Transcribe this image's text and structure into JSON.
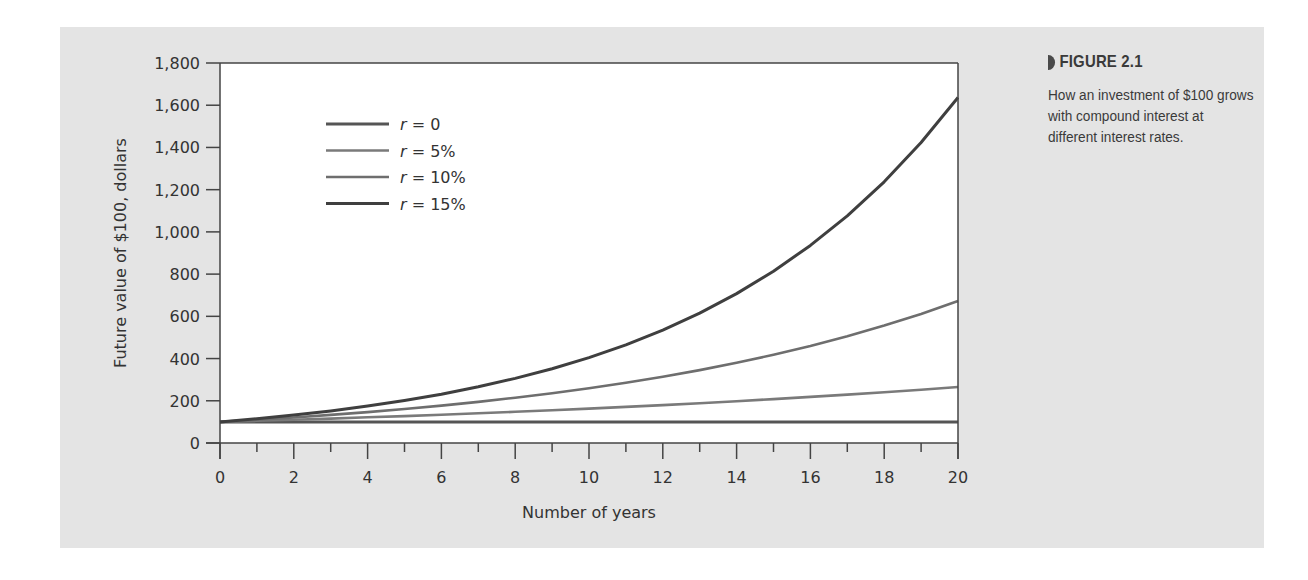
{
  "figure": {
    "label": "FIGURE 2.1",
    "caption": "How an investment of $100 grows with compound interest at different interest rates."
  },
  "colors": {
    "panel_bg": "#e4e4e4",
    "plot_bg": "#ffffff",
    "axis": "#444444",
    "series_r0": "#555555",
    "series_r5": "#7a7a7a",
    "series_r10": "#6e6e6e",
    "series_r15": "#3f3f3f"
  },
  "chart_data": {
    "type": "line",
    "title": "FIGURE 2.1",
    "subtitle": "How an investment of $100 grows with compound interest at different interest rates.",
    "xlabel": "Number of years",
    "ylabel": "Future value of $100, dollars",
    "xlim": [
      0,
      20
    ],
    "ylim": [
      0,
      1800
    ],
    "x_ticks": [
      0,
      2,
      4,
      6,
      8,
      10,
      12,
      14,
      16,
      18,
      20
    ],
    "x_minor_ticks": [
      1,
      3,
      5,
      7,
      9,
      11,
      13,
      15,
      17,
      19
    ],
    "y_ticks": [
      0,
      200,
      400,
      600,
      800,
      1000,
      1200,
      1400,
      1600,
      1800
    ],
    "y_tick_labels": [
      "0",
      "200",
      "400",
      "600",
      "800",
      "1,000",
      "1,200",
      "1,400",
      "1,600",
      "1,800"
    ],
    "grid": false,
    "legend_position": "upper-left inside plot",
    "x": [
      0,
      1,
      2,
      3,
      4,
      5,
      6,
      7,
      8,
      9,
      10,
      11,
      12,
      13,
      14,
      15,
      16,
      17,
      18,
      19,
      20
    ],
    "series": [
      {
        "name": "r = 0",
        "values": [
          100,
          100,
          100,
          100,
          100,
          100,
          100,
          100,
          100,
          100,
          100,
          100,
          100,
          100,
          100,
          100,
          100,
          100,
          100,
          100,
          100
        ]
      },
      {
        "name": "r = 5%",
        "values": [
          100,
          105,
          110.3,
          115.8,
          121.6,
          127.6,
          134,
          140.7,
          147.7,
          155.1,
          162.9,
          171,
          179.6,
          188.6,
          198,
          207.9,
          218.3,
          229.2,
          240.7,
          252.7,
          265.3
        ]
      },
      {
        "name": "r = 10%",
        "values": [
          100,
          110,
          121,
          133.1,
          146.4,
          161.1,
          177.2,
          194.9,
          214.4,
          235.8,
          259.4,
          285.3,
          313.8,
          345.2,
          379.7,
          417.7,
          459.5,
          505.4,
          556,
          611.6,
          672.7
        ]
      },
      {
        "name": "r = 15%",
        "values": [
          100,
          115,
          132.3,
          152.1,
          174.9,
          201.1,
          231.3,
          266,
          305.9,
          351.8,
          404.6,
          465.2,
          535,
          615.3,
          707.6,
          813.7,
          935.8,
          1076.1,
          1237.5,
          1423.2,
          1636.7
        ]
      }
    ]
  }
}
